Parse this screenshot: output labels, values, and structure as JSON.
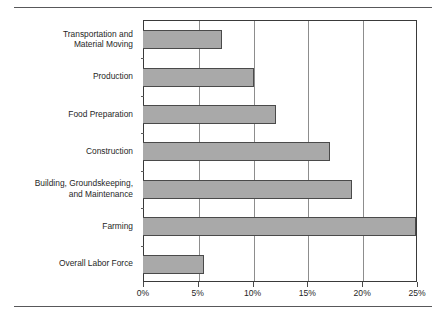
{
  "figure": {
    "top_rule": "",
    "bottom_rule": ""
  },
  "chart_data": {
    "type": "bar",
    "orientation": "horizontal",
    "title": "",
    "subtitle": "",
    "xlabel": "",
    "ylabel": "",
    "categories": [
      "Transportation and\nMaterial Moving",
      "Production",
      "Food Preparation",
      "Construction",
      "Building, Groundskeeping,\nand Maintenance",
      "Farming",
      "Overall Labor Force"
    ],
    "values": [
      7.1,
      10.0,
      12.0,
      17.0,
      19.0,
      25.0,
      5.5
    ],
    "value_unit": "%",
    "xlim": [
      0,
      25
    ],
    "xticks": [
      0,
      5,
      10,
      15,
      20,
      25
    ],
    "xticklabels": [
      "0%",
      "5%",
      "10%",
      "15%",
      "20%",
      "25%"
    ],
    "grid": "vertical",
    "legend": "none",
    "bar_color": "#a9a9a9",
    "bar_edge_color": "#4a4a4a",
    "axis_color": "#3a3a3a",
    "grid_color": "#8d8d8d"
  }
}
